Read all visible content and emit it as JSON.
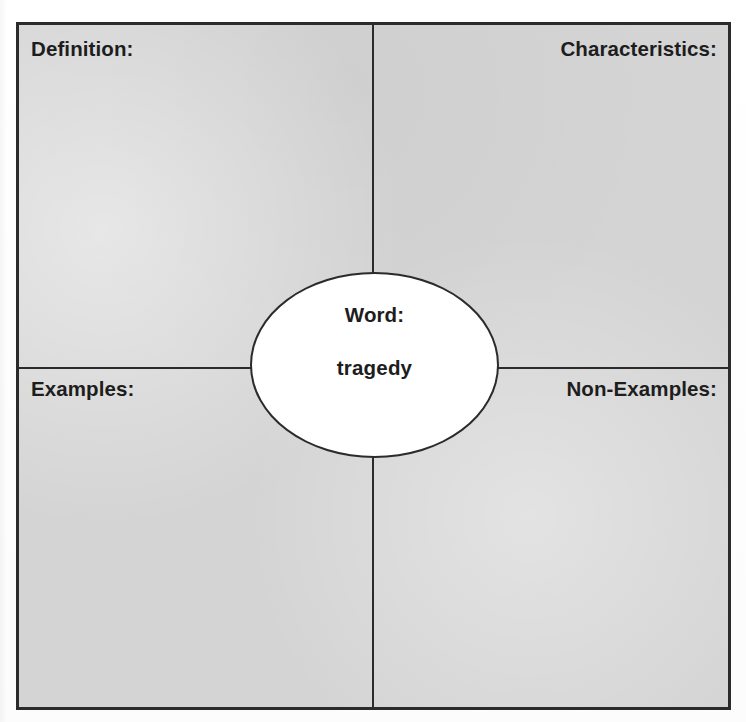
{
  "worksheet": {
    "type": "frayer-model-vocabulary-organizer",
    "quadrants": {
      "top_left": "Definition:",
      "top_right": "Characteristics:",
      "bottom_left": "Examples:",
      "bottom_right": "Non-Examples:"
    },
    "center": {
      "word_label": "Word:",
      "word_value": "tragedy"
    },
    "colors": {
      "panel_fill": "#d4d4d4",
      "line": "#2b2b2b",
      "center_fill": "#ffffff",
      "text": "#1d1d1d",
      "page": "#fdfdfd"
    }
  }
}
